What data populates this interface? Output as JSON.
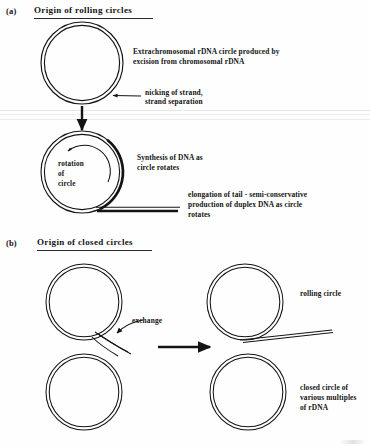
{
  "figure": {
    "background_color": "#fefefe",
    "ink_color": "#141414"
  },
  "panels": [
    {
      "tag": "(a)",
      "heading": "Origin of rolling circles",
      "annotations": [
        {
          "name": "extrachromosomal-rdna-note",
          "lines": [
            "Extrachromosomal rDNA circle produced by",
            "excision from chromosomal rDNA"
          ]
        },
        {
          "name": "nicking-note",
          "lines": [
            "nicking of strand,",
            "strand separation"
          ]
        },
        {
          "name": "rotation-note",
          "lines": [
            "rotation",
            "of",
            "circle"
          ]
        },
        {
          "name": "synthesis-note",
          "lines": [
            "Synthesis of DNA as",
            "circle rotates"
          ]
        },
        {
          "name": "elongation-note",
          "lines": [
            "elongation of tail - semi-conservative",
            "production of duplex DNA as circle",
            "rotates"
          ]
        }
      ]
    },
    {
      "tag": "(b)",
      "heading": "Origin of closed circles",
      "annotations": [
        {
          "name": "exchange-note",
          "lines": [
            "exchange"
          ]
        },
        {
          "name": "rolling-circle-note",
          "lines": [
            "rolling circle"
          ]
        },
        {
          "name": "closed-circle-note",
          "lines": [
            "closed circle of",
            "various multiples",
            "of rDNA"
          ]
        }
      ]
    }
  ],
  "labels": {
    "panel_a_tag": "(a)",
    "panel_a_heading": "Origin of rolling circles",
    "panel_b_tag": "(b)",
    "panel_b_heading": "Origin of closed circles",
    "extrachromosomal_line1": "Extrachromosomal rDNA circle produced by",
    "extrachromosomal_line2": "excision from chromosomal rDNA",
    "nicking_line1": "nicking of strand,",
    "nicking_line2": "strand separation",
    "rotation_line1": "rotation",
    "rotation_line2": "of",
    "rotation_line3": "circle",
    "synthesis_line1": "Synthesis of DNA as",
    "synthesis_line2": "circle rotates",
    "elongation_line1": "elongation of tail - semi-conservative",
    "elongation_line2": "production of duplex DNA as circle",
    "elongation_line3": "rotates",
    "exchange": "exchange",
    "rolling_circle": "rolling circle",
    "closed_line1": "closed circle of",
    "closed_line2": "various multiples",
    "closed_line3": "of rDNA"
  },
  "shapes": {
    "circle_a_top": {
      "name": "rdna-circle",
      "cx": 82,
      "cy": 63,
      "r_outer": 41,
      "r_inner": 38
    },
    "circle_a_rolling": {
      "name": "rolling-circle",
      "cx": 82,
      "cy": 172,
      "r_outer": 41,
      "r_inner": 38
    },
    "circle_b_upper_left": {
      "name": "closed-circle-upper",
      "cx": 84,
      "cy": 303,
      "r_outer": 38,
      "r_inner": 35
    },
    "circle_b_lower_left": {
      "name": "closed-circle-lower",
      "cx": 84,
      "cy": 392,
      "r_outer": 38,
      "r_inner": 35
    },
    "circle_b_upper_right": {
      "name": "rolling-circle-product",
      "cx": 245,
      "cy": 303,
      "r_outer": 38,
      "r_inner": 35
    },
    "circle_b_lower_right": {
      "name": "closed-circle-product",
      "cx": 248,
      "cy": 392,
      "r_outer": 38,
      "r_inner": 35
    },
    "tail_a": {
      "name": "duplex-tail",
      "x_start": 96,
      "x_end": 180,
      "y": 210
    },
    "tail_b": {
      "name": "rolling-circle-tail",
      "x_start": 250,
      "x_end": 330,
      "y": 337
    },
    "arrow_down": {
      "name": "down-arrow",
      "x": 82,
      "y_start": 106,
      "y_end": 132
    },
    "arrow_right": {
      "name": "right-arrow",
      "x_start": 160,
      "x_end": 215,
      "y": 347
    }
  },
  "colors": {
    "ink": "#141414",
    "rule": "#2b2b2b",
    "paper": "#fefefe",
    "scan_artifact": "#d8d8d8"
  }
}
